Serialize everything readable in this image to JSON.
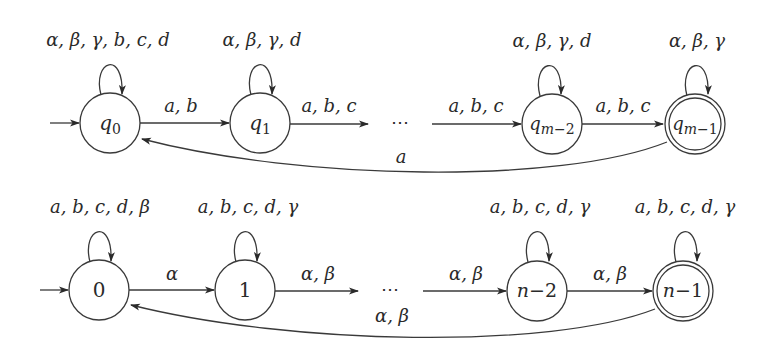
{
  "diagram": {
    "type": "finite-automata",
    "automata": [
      {
        "id": "top",
        "states": [
          {
            "id": "q0",
            "label": "q0",
            "initial": true,
            "accepting": false,
            "loop": "α, β, γ, b, c, d"
          },
          {
            "id": "q1",
            "label": "q1",
            "initial": false,
            "accepting": false,
            "loop": "α, β, γ, d"
          },
          {
            "id": "qm-2",
            "label": "qm−2",
            "initial": false,
            "accepting": false,
            "loop": "α, β, γ, d"
          },
          {
            "id": "qm-1",
            "label": "qm−1",
            "initial": false,
            "accepting": true,
            "loop": "α, β, γ"
          }
        ],
        "transitions": [
          {
            "from": "q0",
            "to": "q1",
            "label": "a, b"
          },
          {
            "from": "q1",
            "to": "ellipsis",
            "label": "a, b, c"
          },
          {
            "from": "ellipsis",
            "to": "qm-2",
            "label": "a, b, c"
          },
          {
            "from": "qm-2",
            "to": "qm-1",
            "label": "a, b, c"
          },
          {
            "from": "qm-1",
            "to": "q0",
            "label": "a"
          }
        ],
        "ellipsis": "⋯"
      },
      {
        "id": "bottom",
        "states": [
          {
            "id": "s0",
            "label": "0",
            "initial": true,
            "accepting": false,
            "loop": "a, b, c, d, β"
          },
          {
            "id": "s1",
            "label": "1",
            "initial": false,
            "accepting": false,
            "loop": "a, b, c, d, γ"
          },
          {
            "id": "sn-2",
            "label": "n−2",
            "initial": false,
            "accepting": false,
            "loop": "a, b, c, d, γ"
          },
          {
            "id": "sn-1",
            "label": "n−1",
            "initial": false,
            "accepting": true,
            "loop": "a, b, c, d, γ"
          }
        ],
        "transitions": [
          {
            "from": "s0",
            "to": "s1",
            "label": "α"
          },
          {
            "from": "s1",
            "to": "ellipsis",
            "label": "α, β"
          },
          {
            "from": "ellipsis",
            "to": "sn-2",
            "label": "α, β"
          },
          {
            "from": "sn-2",
            "to": "sn-1",
            "label": "α, β"
          },
          {
            "from": "sn-1",
            "to": "s0",
            "label": "α, β"
          }
        ],
        "ellipsis": "⋯"
      }
    ]
  }
}
